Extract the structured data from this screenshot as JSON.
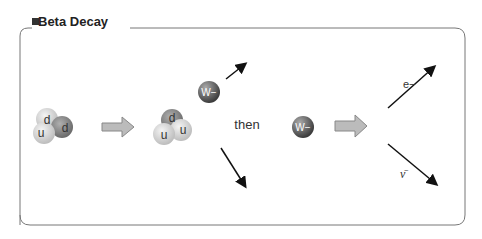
{
  "title": "Beta Decay",
  "diagram": {
    "neutron": {
      "quarks": [
        "u",
        "d",
        "d"
      ]
    },
    "proton": {
      "quarks": [
        "u",
        "u",
        "d"
      ]
    },
    "boson": "W−",
    "connector": "then",
    "electron": "e−",
    "antineutrino": "ν̄"
  }
}
